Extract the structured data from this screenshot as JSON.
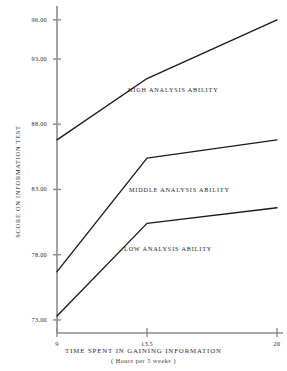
{
  "chart_data": {
    "type": "line",
    "title": "THE RESULTS OF THE TEST",
    "xlabel": "TIME SPENT IN GAINING INFORMATION",
    "xlabel_sub": "( Hours per 5 weeks )",
    "ylabel": "SCORE ON INFORMATION TEST",
    "x": [
      9,
      13.5,
      20
    ],
    "xticklabels": [
      "9",
      "13.5",
      "20"
    ],
    "yticks": [
      73.0,
      78.0,
      83.0,
      88.0,
      93.0,
      96.0
    ],
    "yticklabels": [
      "73.00",
      "78.00",
      "83.00",
      "88.00",
      "93.00",
      "96.00"
    ],
    "xlim": [
      9,
      20
    ],
    "ylim": [
      72.0,
      96.6
    ],
    "grid": false,
    "legend": "inline-annotations",
    "line_color": "#1a1a1a",
    "axis_color": "#8c8c8c",
    "series": [
      {
        "name": "HIGH ANALYSIS ABILITY",
        "values": [
          86.8,
          91.5,
          96.0
        ],
        "annotation_x": 128,
        "annotation_y": 86
      },
      {
        "name": "MIDDLE ANALYSIS ABILITY",
        "values": [
          76.7,
          85.4,
          86.8
        ],
        "annotation_x": 129,
        "annotation_y": 186
      },
      {
        "name": "LOW ANALYSIS ABILITY",
        "values": [
          73.3,
          80.4,
          81.6
        ],
        "annotation_x": 124,
        "annotation_y": 245
      }
    ]
  }
}
